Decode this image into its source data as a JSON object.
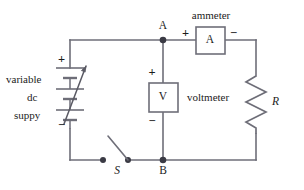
{
  "diagram": {
    "colors": {
      "background": "#ffffff",
      "wire": "#6e6e78",
      "ink": "#1c1c1c",
      "node": "#3a3a44"
    }
  },
  "source": {
    "label_line1": "variable",
    "label_line2": "dc",
    "label_line3": "suppy",
    "plus": "+",
    "minus": "−"
  },
  "ammeter": {
    "caption": "ammeter",
    "symbol": "A",
    "plus": "+",
    "minus": "−"
  },
  "voltmeter": {
    "caption": "voltmeter",
    "symbol": "V",
    "plus": "+",
    "minus": "−"
  },
  "resistor": {
    "label": "R"
  },
  "switch": {
    "label": "S"
  },
  "nodes": {
    "a": "A",
    "b": "B"
  }
}
